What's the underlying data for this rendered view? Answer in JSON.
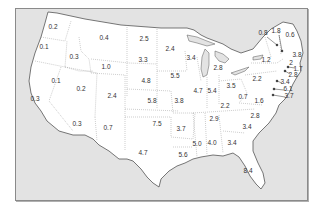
{
  "map": {
    "region": "Contiguous United States",
    "colors": {
      "land": "#ffffff",
      "water": "#e3e3e3",
      "border": "#555555",
      "state_border": "#9a9a9a",
      "text": "#333333"
    },
    "state_values": [
      {
        "state": "WA",
        "value": "0.2",
        "x": 53,
        "y": 27
      },
      {
        "state": "OR",
        "value": "0.1",
        "x": 44,
        "y": 47
      },
      {
        "state": "ID",
        "value": "0.3",
        "x": 74,
        "y": 57
      },
      {
        "state": "MT",
        "value": "0.4",
        "x": 104,
        "y": 38
      },
      {
        "state": "ND",
        "value": "2.5",
        "x": 144,
        "y": 39
      },
      {
        "state": "MN",
        "value": "2.4",
        "x": 170,
        "y": 49
      },
      {
        "state": "WY",
        "value": "1.0",
        "x": 106,
        "y": 67
      },
      {
        "state": "SD",
        "value": "3.3",
        "x": 143,
        "y": 60
      },
      {
        "state": "NV",
        "value": "0.1",
        "x": 56,
        "y": 81
      },
      {
        "state": "UT",
        "value": "0.2",
        "x": 81,
        "y": 89
      },
      {
        "state": "CO",
        "value": "2.4",
        "x": 112,
        "y": 96
      },
      {
        "state": "NE",
        "value": "4.8",
        "x": 146,
        "y": 81
      },
      {
        "state": "KS",
        "value": "5.8",
        "x": 152,
        "y": 101
      },
      {
        "state": "IA",
        "value": "5.5",
        "x": 175,
        "y": 76
      },
      {
        "state": "MO",
        "value": "3.8",
        "x": 179,
        "y": 101
      },
      {
        "state": "CA",
        "value": "0.3",
        "x": 35,
        "y": 99
      },
      {
        "state": "AZ",
        "value": "0.3",
        "x": 77,
        "y": 124
      },
      {
        "state": "NM",
        "value": "0.7",
        "x": 108,
        "y": 128
      },
      {
        "state": "OK",
        "value": "7.5",
        "x": 157,
        "y": 124
      },
      {
        "state": "TX",
        "value": "4.7",
        "x": 143,
        "y": 153
      },
      {
        "state": "AR",
        "value": "3.7",
        "x": 181,
        "y": 129
      },
      {
        "state": "LA",
        "value": "5.6",
        "x": 183,
        "y": 155
      },
      {
        "state": "MS",
        "value": "5.0",
        "x": 197,
        "y": 144
      },
      {
        "state": "AL",
        "value": "4.0",
        "x": 212,
        "y": 143
      },
      {
        "state": "GA",
        "value": "3.4",
        "x": 232,
        "y": 143
      },
      {
        "state": "FL",
        "value": "8.4",
        "x": 248,
        "y": 171
      },
      {
        "state": "WI",
        "value": "3.4",
        "x": 191,
        "y": 58
      },
      {
        "state": "MI",
        "value": "2.8",
        "x": 218,
        "y": 68
      },
      {
        "state": "IL",
        "value": "4.7",
        "x": 198,
        "y": 91
      },
      {
        "state": "IN",
        "value": "5.4",
        "x": 212,
        "y": 91
      },
      {
        "state": "OH",
        "value": "3.5",
        "x": 231,
        "y": 86
      },
      {
        "state": "KY",
        "value": "2.2",
        "x": 225,
        "y": 106
      },
      {
        "state": "TN",
        "value": "2.9",
        "x": 214,
        "y": 119
      },
      {
        "state": "WV",
        "value": "0.7",
        "x": 243,
        "y": 97
      },
      {
        "state": "VA",
        "value": "1.6",
        "x": 259,
        "y": 101
      },
      {
        "state": "NC",
        "value": "2.8",
        "x": 255,
        "y": 116
      },
      {
        "state": "SC",
        "value": "3.4",
        "x": 247,
        "y": 127
      },
      {
        "state": "PA",
        "value": "2.2",
        "x": 257,
        "y": 79
      },
      {
        "state": "NY",
        "value": "1.2",
        "x": 266,
        "y": 60
      },
      {
        "state": "VT",
        "value": "0.8",
        "x": 263,
        "y": 33
      },
      {
        "state": "NH",
        "value": "1.8",
        "x": 276,
        "y": 31
      },
      {
        "state": "ME",
        "value": "0.6",
        "x": 290,
        "y": 35
      },
      {
        "state": "MA",
        "value": "3.8",
        "x": 297,
        "y": 55
      },
      {
        "state": "RI",
        "value": "1.7",
        "x": 298,
        "y": 69
      },
      {
        "state": "CT",
        "value": "2.8",
        "x": 293,
        "y": 75
      },
      {
        "state": "NJ",
        "value": "3.4",
        "x": 285,
        "y": 82
      },
      {
        "state": "DE",
        "value": "6.1",
        "x": 288,
        "y": 89
      },
      {
        "state": "MD",
        "value": "3.7",
        "x": 289,
        "y": 96
      },
      {
        "state": "RI-marker",
        "value": "2",
        "x": 291,
        "y": 63
      }
    ]
  }
}
